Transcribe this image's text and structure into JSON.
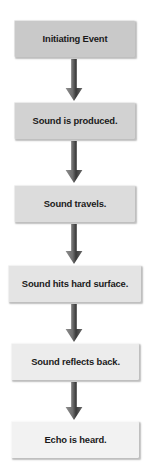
{
  "diagram": {
    "orientation": "vertical-top-to-bottom",
    "background_color": "#ffffff",
    "arrow_color_top": "#8e8e8e",
    "arrow_color_bottom": "#3a3a3a",
    "text_color": "#1a1a1a",
    "nodes": [
      {
        "id": "node-1",
        "label": "Initiating Event",
        "fill_color": "#c9c9c9",
        "x": 14,
        "y": 20,
        "width": 121,
        "height": 37
      },
      {
        "id": "node-2",
        "label": "Sound is produced.",
        "fill_color": "#d2d2d2",
        "x": 14,
        "y": 102,
        "width": 121,
        "height": 37
      },
      {
        "id": "node-3",
        "label": "Sound travels.",
        "fill_color": "#dcdcdc",
        "x": 14,
        "y": 185,
        "width": 121,
        "height": 37
      },
      {
        "id": "node-4",
        "label": "Sound hits hard surface.",
        "fill_color": "#e4e4e4",
        "x": 8,
        "y": 265,
        "width": 133,
        "height": 37
      },
      {
        "id": "node-5",
        "label": "Sound reflects back.",
        "fill_color": "#ececec",
        "x": 11,
        "y": 343,
        "width": 128,
        "height": 37
      },
      {
        "id": "node-6",
        "label": "Echo is heard.",
        "fill_color": "#f2f2f2",
        "x": 11,
        "y": 421,
        "width": 128,
        "height": 37
      }
    ],
    "connectors": [
      {
        "id": "connector-1",
        "from": "node-1",
        "to": "node-2",
        "x": 65,
        "y": 59,
        "height": 42
      },
      {
        "id": "connector-2",
        "from": "node-2",
        "to": "node-3",
        "x": 65,
        "y": 141,
        "height": 42
      },
      {
        "id": "connector-3",
        "from": "node-3",
        "to": "node-4",
        "x": 65,
        "y": 224,
        "height": 40
      },
      {
        "id": "connector-4",
        "from": "node-4",
        "to": "node-5",
        "x": 65,
        "y": 304,
        "height": 38
      },
      {
        "id": "connector-5",
        "from": "node-5",
        "to": "node-6",
        "x": 65,
        "y": 382,
        "height": 38
      }
    ]
  }
}
